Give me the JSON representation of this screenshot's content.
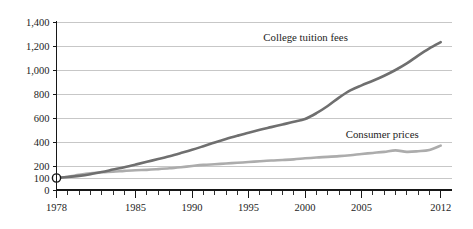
{
  "chart_data": {
    "type": "line",
    "title": "",
    "subtitle": "",
    "xlabel": "",
    "ylabel": "",
    "index_base": "1978 = 100",
    "xlim": [
      1978,
      2013
    ],
    "ylim": [
      0,
      1400
    ],
    "grid": true,
    "grid_axis": "y",
    "legend_position": "inline-annotations",
    "y_ticks": [
      0,
      100,
      200,
      400,
      600,
      800,
      1000,
      1200,
      1400
    ],
    "y_tick_labels": [
      "0",
      "100",
      "200",
      "400",
      "600",
      "800",
      "1,000",
      "1,200",
      "1,400"
    ],
    "x_ticks": [
      1978,
      1979,
      1980,
      1981,
      1982,
      1983,
      1984,
      1985,
      1986,
      1987,
      1988,
      1989,
      1990,
      1991,
      1992,
      1993,
      1994,
      1995,
      1996,
      1997,
      1998,
      1999,
      2000,
      2001,
      2002,
      2003,
      2004,
      2005,
      2006,
      2007,
      2008,
      2009,
      2010,
      2011,
      2012
    ],
    "x_tick_labels": [
      "1978",
      "1985",
      "1990",
      "1995",
      "2000",
      "2005",
      "2012"
    ],
    "x_labeled_ticks": [
      1978,
      1985,
      1990,
      1995,
      2000,
      2005,
      2012
    ],
    "origin_marker": {
      "x": 1978,
      "y": 100,
      "label": ""
    },
    "series": [
      {
        "name": "College tuition fees",
        "color": "#6f6f6f",
        "stroke_width": 2.6,
        "label_x": 1996.3,
        "label_y": 1245,
        "x": [
          1978,
          1979,
          1980,
          1981,
          1982,
          1983,
          1984,
          1985,
          1986,
          1987,
          1988,
          1989,
          1990,
          1991,
          1992,
          1993,
          1994,
          1995,
          1996,
          1997,
          1998,
          1999,
          2000,
          2001,
          2002,
          2003,
          2004,
          2005,
          2006,
          2007,
          2008,
          2009,
          2010,
          2011,
          2012
        ],
        "values": [
          100,
          108,
          118,
          132,
          150,
          170,
          190,
          212,
          235,
          258,
          282,
          308,
          335,
          365,
          396,
          425,
          452,
          478,
          502,
          524,
          546,
          568,
          592,
          640,
          700,
          770,
          830,
          872,
          910,
          952,
          1000,
          1055,
          1120,
          1180,
          1232
        ]
      },
      {
        "name": "Consumer prices",
        "color": "#acacac",
        "stroke_width": 2.6,
        "label_x": 2003.6,
        "label_y": 430,
        "x": [
          1978,
          1979,
          1980,
          1981,
          1982,
          1983,
          1984,
          1985,
          1986,
          1987,
          1988,
          1989,
          1990,
          1991,
          1992,
          1993,
          1994,
          1995,
          1996,
          1997,
          1998,
          1999,
          2000,
          2001,
          2002,
          2003,
          2004,
          2005,
          2006,
          2007,
          2008,
          2009,
          2010,
          2011,
          2012
        ],
        "values": [
          100,
          111,
          126,
          139,
          148,
          152,
          159,
          165,
          168,
          174,
          181,
          190,
          200,
          209,
          215,
          221,
          227,
          233,
          240,
          246,
          250,
          255,
          264,
          271,
          276,
          282,
          290,
          300,
          309,
          318,
          330,
          318,
          323,
          334,
          370
        ]
      }
    ],
    "annotations": [
      {
        "text": "College tuition fees",
        "series": "College tuition fees"
      },
      {
        "text": "Consumer prices",
        "series": "Consumer prices"
      }
    ],
    "colors": {
      "gridline": "#b9b9b9",
      "axis": "#171717",
      "text": "#1d1d1d",
      "background": "#ffffff",
      "tuition": "#6f6f6f",
      "consumer": "#acacac"
    }
  }
}
